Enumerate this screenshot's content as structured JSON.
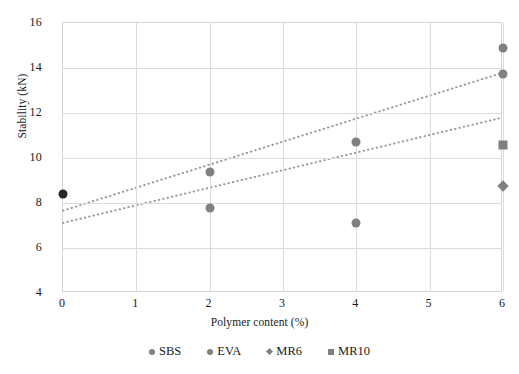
{
  "chart_data": {
    "type": "scatter",
    "title": "",
    "xlabel": "Polymer content (%)",
    "ylabel": "Stability (kN)",
    "xlim": [
      0,
      6
    ],
    "ylim": [
      4,
      16
    ],
    "xticks": [
      0,
      1,
      2,
      3,
      4,
      5,
      6
    ],
    "yticks": [
      4,
      6,
      8,
      10,
      12,
      14,
      16
    ],
    "grid": true,
    "legend_position": "bottom",
    "series": [
      {
        "name": "SBS",
        "marker": "circle",
        "color": "#808080",
        "points": [
          {
            "x": 0,
            "y": 8.4,
            "color": "#262626"
          },
          {
            "x": 2,
            "y": 9.4
          },
          {
            "x": 4,
            "y": 10.7
          },
          {
            "x": 6,
            "y": 14.9
          },
          {
            "x": 6,
            "y": 13.75
          }
        ]
      },
      {
        "name": "EVA",
        "marker": "circle",
        "color": "#808080",
        "points": [
          {
            "x": 2,
            "y": 7.8
          },
          {
            "x": 4,
            "y": 7.1
          }
        ]
      },
      {
        "name": "MR6",
        "marker": "diamond",
        "color": "#808080",
        "points": [
          {
            "x": 6,
            "y": 8.75
          }
        ]
      },
      {
        "name": "MR10",
        "marker": "square",
        "color": "#808080",
        "points": [
          {
            "x": 6,
            "y": 10.6
          }
        ]
      }
    ],
    "trendlines": [
      {
        "name": "trendline-upper",
        "x0": 0,
        "y0": 7.6,
        "x1": 6,
        "y1": 13.75,
        "color": "#9a9a9a",
        "style": "dotted"
      },
      {
        "name": "trendline-lower",
        "x0": 0,
        "y0": 7.05,
        "x1": 6,
        "y1": 11.75,
        "color": "#9a9a9a",
        "style": "dotted"
      }
    ]
  },
  "legend": {
    "items": [
      {
        "label": "SBS",
        "marker": "circle",
        "color": "#808080"
      },
      {
        "label": "EVA",
        "marker": "circle",
        "color": "#808080"
      },
      {
        "label": "MR6",
        "marker": "diamond",
        "color": "#808080"
      },
      {
        "label": "MR10",
        "marker": "square",
        "color": "#808080"
      }
    ]
  },
  "colors": {
    "grid": "#dcdcdc",
    "frame": "#d4d4d4",
    "marker": "#808080",
    "marker_dark": "#262626",
    "trend": "#9a9a9a",
    "text": "#1a1a1a",
    "background": "#ffffff"
  }
}
